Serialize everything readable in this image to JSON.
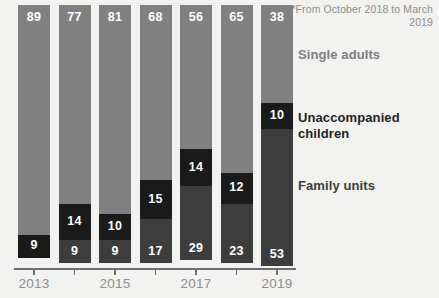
{
  "footnote": "*From October 2018 to March 2019",
  "legend": {
    "single": "Single adults",
    "unaccompanied": "Unaccompanied children",
    "family": "Family units"
  },
  "axis": {
    "ticks": [
      "2013",
      "2014",
      "2015",
      "2016",
      "2017",
      "2018",
      "2019"
    ],
    "visible_labels": [
      "2013",
      "2015",
      "2017",
      "2019"
    ]
  },
  "colors": {
    "single_adults": "#808080",
    "unaccompanied_children": "#1a1a1a",
    "family_units": "#3d3d3d",
    "background": "#f2f2f0",
    "axis": "#6e6e6e",
    "muted_text": "#8e8e8e"
  },
  "chart_data": {
    "type": "bar",
    "title": "",
    "subtitle": "",
    "xlabel": "",
    "ylabel": "",
    "stacked": true,
    "normalized_percent": true,
    "ylim": [
      0,
      100
    ],
    "grid": false,
    "legend_position": "right",
    "annotations": [
      "*From October 2018 to March 2019"
    ],
    "categories": [
      "2013",
      "2014",
      "2015",
      "2016",
      "2017",
      "2018",
      "2019"
    ],
    "series": [
      {
        "name": "Single adults",
        "color": "#808080",
        "values": [
          89,
          77,
          81,
          68,
          56,
          65,
          38
        ]
      },
      {
        "name": "Unaccompanied children",
        "color": "#1a1a1a",
        "values": [
          9,
          14,
          10,
          15,
          14,
          12,
          10
        ]
      },
      {
        "name": "Family units",
        "color": "#3d3d3d",
        "values": [
          0,
          9,
          9,
          17,
          29,
          23,
          53
        ]
      }
    ]
  }
}
